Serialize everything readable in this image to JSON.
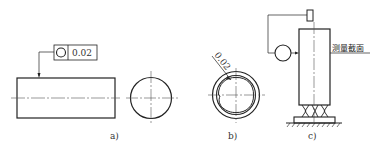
{
  "figure_a": {
    "label": "a)",
    "tolerance_symbol": "circularity-icon",
    "tolerance_value": "0.02"
  },
  "figure_b": {
    "label": "b)",
    "dimension": "0.02"
  },
  "figure_c": {
    "label": "c)",
    "annotation": "测量截面"
  },
  "colors": {
    "line": "#222222",
    "center_line": "#555555"
  }
}
